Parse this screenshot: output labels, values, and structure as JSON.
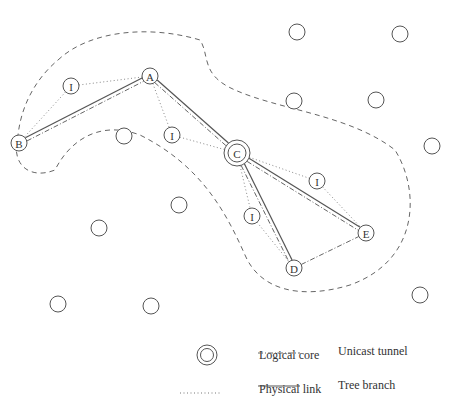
{
  "diagram": {
    "colors": {
      "stroke": "#555555",
      "text": "#333333",
      "background": "#ffffff"
    },
    "boundary": {
      "style": "dashed",
      "path": "M 58 60 C 90 30, 150 25, 200 40 C 210 55, 200 75, 235 90 C 280 110, 350 115, 395 150 C 420 190, 420 260, 350 285 C 300 300, 260 290, 245 255 C 225 210, 200 165, 140 135 C 100 120, 70 140, 55 170 C 30 180, 10 165, 18 135 C 22 100, 40 75, 58 60 Z"
    },
    "nodes": [
      {
        "id": "A",
        "label": "A",
        "x": 150,
        "y": 76,
        "r": 8,
        "type": "member"
      },
      {
        "id": "B",
        "label": "B",
        "x": 19,
        "y": 143,
        "r": 8,
        "type": "member"
      },
      {
        "id": "C",
        "label": "C",
        "x": 237,
        "y": 153,
        "r": 13,
        "type": "core"
      },
      {
        "id": "D",
        "label": "D",
        "x": 294,
        "y": 268,
        "r": 8,
        "type": "member"
      },
      {
        "id": "E",
        "label": "E",
        "x": 366,
        "y": 233,
        "r": 8,
        "type": "member"
      },
      {
        "id": "I1",
        "label": "I",
        "x": 71,
        "y": 86,
        "r": 8,
        "type": "intermediate"
      },
      {
        "id": "I2",
        "label": "I",
        "x": 172,
        "y": 135,
        "r": 8,
        "type": "intermediate"
      },
      {
        "id": "I3",
        "label": "I",
        "x": 317,
        "y": 181,
        "r": 8,
        "type": "intermediate"
      },
      {
        "id": "I4",
        "label": "I",
        "x": 252,
        "y": 216,
        "r": 8,
        "type": "intermediate"
      },
      {
        "id": "n1",
        "label": "",
        "x": 297,
        "y": 32,
        "r": 8,
        "type": "other"
      },
      {
        "id": "n2",
        "label": "",
        "x": 400,
        "y": 34,
        "r": 8,
        "type": "other"
      },
      {
        "id": "n3",
        "label": "",
        "x": 294,
        "y": 101,
        "r": 8,
        "type": "other"
      },
      {
        "id": "n4",
        "label": "",
        "x": 376,
        "y": 100,
        "r": 8,
        "type": "other"
      },
      {
        "id": "n5",
        "label": "",
        "x": 432,
        "y": 146,
        "r": 8,
        "type": "other"
      },
      {
        "id": "n6",
        "label": "",
        "x": 124,
        "y": 136,
        "r": 8,
        "type": "other"
      },
      {
        "id": "n7",
        "label": "",
        "x": 179,
        "y": 205,
        "r": 8,
        "type": "other"
      },
      {
        "id": "n8",
        "label": "",
        "x": 99,
        "y": 228,
        "r": 8,
        "type": "other"
      },
      {
        "id": "n9",
        "label": "",
        "x": 58,
        "y": 304,
        "r": 8,
        "type": "other"
      },
      {
        "id": "n10",
        "label": "",
        "x": 151,
        "y": 306,
        "r": 8,
        "type": "other"
      },
      {
        "id": "n11",
        "label": "",
        "x": 420,
        "y": 295,
        "r": 8,
        "type": "other"
      }
    ],
    "physical_links": [
      [
        "I1",
        "A"
      ],
      [
        "I1",
        "B"
      ],
      [
        "A",
        "I2"
      ],
      [
        "I2",
        "C"
      ],
      [
        "C",
        "I3"
      ],
      [
        "I3",
        "E"
      ],
      [
        "C",
        "I4"
      ],
      [
        "I4",
        "D"
      ]
    ],
    "tree_branches": [
      [
        "B",
        "A"
      ],
      [
        "A",
        "C"
      ],
      [
        "C",
        "D"
      ],
      [
        "C",
        "E"
      ]
    ],
    "unicast_tunnels": [
      [
        "B",
        "A"
      ],
      [
        "A",
        "C"
      ],
      [
        "C",
        "D"
      ],
      [
        "C",
        "E"
      ],
      [
        "D",
        "E"
      ]
    ]
  },
  "legend": {
    "logical_core": "Logical core",
    "physical_link": "Physical link",
    "unicast_tunnel": "Unicast tunnel",
    "tree_branch": "Tree branch"
  }
}
